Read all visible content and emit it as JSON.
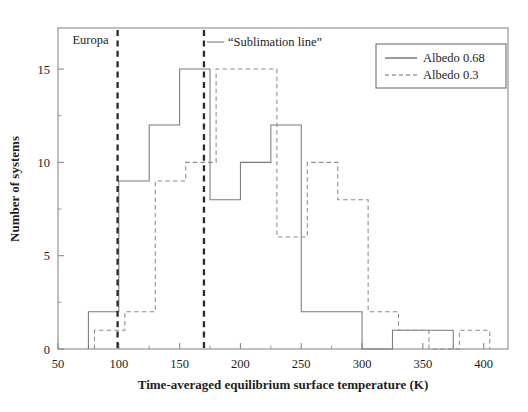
{
  "chart_data": {
    "type": "bar",
    "title": "",
    "xlabel": "Time-averaged equilibrium surface temperature (K)",
    "ylabel": "Number of systems",
    "xlim": [
      50,
      420
    ],
    "ylim": [
      0,
      17.2
    ],
    "xticks": [
      50,
      100,
      150,
      200,
      250,
      300,
      350,
      400
    ],
    "xticklabels": [
      "50",
      "100",
      "150",
      "200",
      "250",
      "300",
      "350",
      "400"
    ],
    "yticks": [
      0,
      5,
      10,
      15
    ],
    "yticklabels": [
      "0",
      "5",
      "10",
      "15"
    ],
    "grid": false,
    "legend_position": "upper right",
    "series": [
      {
        "name": "Albedo 0.68",
        "style": "solid",
        "bin_edges": [
          75,
          100,
          125,
          150,
          175,
          200,
          225,
          250,
          275,
          300,
          325,
          350,
          375
        ],
        "values": [
          2,
          9,
          12,
          15,
          8,
          10,
          12,
          2,
          2,
          0,
          1,
          1
        ]
      },
      {
        "name": "Albedo 0.3",
        "style": "dashed",
        "bin_edges": [
          80,
          105,
          130,
          155,
          180,
          205,
          230,
          255,
          280,
          305,
          330,
          355,
          380,
          405
        ],
        "values": [
          1,
          2,
          9,
          10,
          15,
          15,
          6,
          10,
          8,
          2,
          1,
          0,
          1
        ]
      }
    ],
    "annotations": [
      {
        "name": "europa-line",
        "label": "Europa",
        "x": 99,
        "style": "dashed-vertical"
      },
      {
        "name": "sublimation-line",
        "label": "“Sublimation line”",
        "x": 170,
        "style": "dashed-vertical"
      }
    ]
  },
  "legend": {
    "entries": [
      {
        "label": "Albedo 0.68",
        "style": "solid"
      },
      {
        "label": "Albedo 0.3",
        "style": "dashed"
      }
    ]
  },
  "axes": {
    "x_label": "Time-averaged equilibrium surface temperature (K)",
    "y_label": "Number of systems",
    "x_tick_labels": [
      "50",
      "100",
      "150",
      "200",
      "250",
      "300",
      "350",
      "400"
    ],
    "y_tick_labels": [
      "0",
      "5",
      "10",
      "15"
    ]
  },
  "annotations": {
    "europa": "Europa",
    "sublimation": "“Sublimation line”"
  }
}
